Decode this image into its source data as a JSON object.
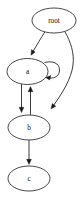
{
  "diagram": {
    "title": "root",
    "type": "directed-graph",
    "layout": "top-down",
    "background_color": "#ffffff",
    "stroke_color": "#1a1a1a",
    "label_color": "#0d0d0d",
    "nodes": [
      {
        "id": "root",
        "label": "root",
        "shape": "ellipse",
        "cx": 54.0,
        "cy": 20.5,
        "rx": 22.0,
        "ry": 12.5
      },
      {
        "id": "a",
        "label": "a",
        "shape": "ellipse",
        "cx": 27.5,
        "cy": 71.5,
        "rx": 20.5,
        "ry": 13.0
      },
      {
        "id": "b",
        "label": "b",
        "shape": "ellipse",
        "cx": 29.0,
        "cy": 127.5,
        "rx": 21.0,
        "ry": 12.5
      },
      {
        "id": "c",
        "label": "c",
        "shape": "ellipse",
        "cx": 29.0,
        "cy": 178.5,
        "rx": 21.0,
        "ry": 12.5
      }
    ],
    "edges": [
      {
        "id": "root-a",
        "from": "root",
        "to": "a",
        "label": "",
        "style": "line",
        "direction": "down-left"
      },
      {
        "id": "root-b",
        "from": "root",
        "to": "b",
        "label": "",
        "style": "curve",
        "direction": "down-left"
      },
      {
        "id": "a-self",
        "from": "a",
        "to": "a",
        "label": "",
        "style": "self-loop",
        "direction": "right-loop"
      },
      {
        "id": "a-b",
        "from": "a",
        "to": "b",
        "label": "",
        "style": "line",
        "direction": "down"
      },
      {
        "id": "b-a",
        "from": "b",
        "to": "a",
        "label": "",
        "style": "line",
        "direction": "up"
      },
      {
        "id": "b-c",
        "from": "b",
        "to": "c",
        "label": "",
        "style": "line",
        "direction": "down"
      }
    ]
  }
}
